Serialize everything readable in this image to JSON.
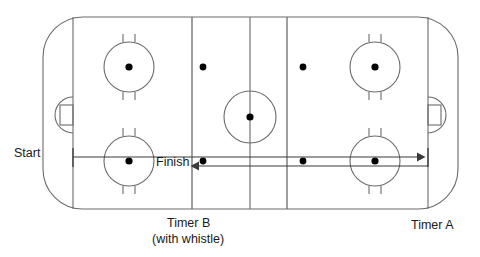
{
  "diagram": {
    "type": "rink-drill",
    "colors": {
      "line": "#4d4d4d",
      "rink_outline": "#666666",
      "dot": "#000000",
      "text": "#1a1a1a",
      "background": "#ffffff",
      "arrow": "#3a3a3a"
    },
    "labels": {
      "start": "Start",
      "finish": "Finish",
      "timer_a": "Timer A",
      "timer_b": "Timer B",
      "timer_b_sub": "(with whistle)"
    },
    "annotations": [
      {
        "name": "start-marker",
        "text": "Start",
        "x": 14,
        "y": 146
      },
      {
        "name": "finish-marker",
        "text": "Finish",
        "x": 156,
        "y": 155
      },
      {
        "name": "timer-a-marker",
        "text": "Timer A",
        "x": 411,
        "y": 218
      },
      {
        "name": "timer-b-marker",
        "text": "Timer B",
        "x": 167,
        "y": 216
      },
      {
        "name": "timer-b-note",
        "text": "(with whistle)",
        "x": 152,
        "y": 232
      }
    ],
    "rink": {
      "left": 43,
      "right": 458,
      "top": 17,
      "bottom": 209,
      "corner_radius": 40,
      "goal_line_left": 73,
      "goal_line_right": 428,
      "blue_line_left": 192,
      "blue_line_right": 287,
      "center_line": 250,
      "center_circle_radius": 26,
      "faceoff_circle_radius": 25,
      "faceoff_dot_radius": 3.4,
      "neutral_dot_radius": 3.2
    },
    "faceoff_circles": [
      {
        "name": "faceoff-circle-top-left",
        "cx": 129,
        "cy": 67
      },
      {
        "name": "faceoff-circle-bottom-left",
        "cx": 129,
        "cy": 161
      },
      {
        "name": "faceoff-circle-top-right",
        "cx": 375,
        "cy": 67
      },
      {
        "name": "faceoff-circle-bottom-right",
        "cx": 375,
        "cy": 161
      }
    ],
    "neutral_dots": [
      {
        "name": "neutral-dot-top-left",
        "cx": 203,
        "cy": 67
      },
      {
        "name": "neutral-dot-top-right",
        "cx": 303,
        "cy": 67
      },
      {
        "name": "neutral-dot-bottom-left",
        "cx": 203,
        "cy": 161
      },
      {
        "name": "neutral-dot-bottom-right",
        "cx": 303,
        "cy": 161
      }
    ],
    "center_faceoff": {
      "name": "center-faceoff-dot",
      "cx": 250,
      "cy": 117
    },
    "paths": [
      {
        "name": "start-to-timer-a-path",
        "description": "upper arrow from start goal line to right goal line",
        "y": 157,
        "x_start": 73,
        "x_end": 424,
        "arrowhead": "right"
      },
      {
        "name": "finish-return-path",
        "description": "lower arrow returning from right goal line to finish line",
        "y": 166,
        "x_start": 428,
        "x_end": 193,
        "arrowhead": "left"
      }
    ],
    "tick_marks": [
      {
        "name": "start-tick",
        "x": 73,
        "y_top": 148,
        "y_bottom": 166
      },
      {
        "name": "timer-a-tick",
        "x": 428,
        "y_top": 148,
        "y_bottom": 166
      }
    ]
  }
}
